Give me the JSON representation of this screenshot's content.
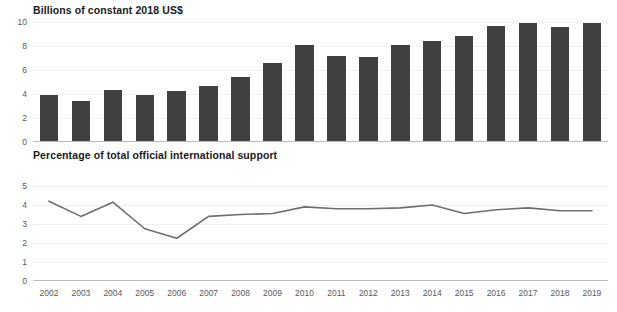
{
  "chart_data": [
    {
      "type": "bar",
      "title": "Billions of constant 2018 US$",
      "xlabel": "",
      "ylabel": "",
      "ylim": [
        0,
        10
      ],
      "yticks": [
        0,
        2,
        4,
        6,
        8,
        10
      ],
      "grid": true,
      "legend": "none",
      "bar_color": "#404042",
      "categories": [
        "2002",
        "2003",
        "2004",
        "2005",
        "2006",
        "2007",
        "2008",
        "2009",
        "2010",
        "2011",
        "2012",
        "2013",
        "2014",
        "2015",
        "2016",
        "2017",
        "2018",
        "2019"
      ],
      "values": [
        3.95,
        3.45,
        4.3,
        3.9,
        4.25,
        4.7,
        5.45,
        6.6,
        8.05,
        7.15,
        7.1,
        8.05,
        8.4,
        8.85,
        9.65,
        9.95,
        9.6,
        9.9
      ]
    },
    {
      "type": "line",
      "title": "Percentage of total official international support",
      "xlabel": "",
      "ylabel": "",
      "ylim": [
        0,
        5
      ],
      "yticks": [
        0,
        1,
        2,
        3,
        4,
        5
      ],
      "grid": true,
      "legend": "none",
      "line_color": "#6d6e71",
      "categories": [
        "2002",
        "2003",
        "2004",
        "2005",
        "2006",
        "2007",
        "2008",
        "2009",
        "2010",
        "2011",
        "2012",
        "2013",
        "2014",
        "2015",
        "2016",
        "2017",
        "2018",
        "2019"
      ],
      "values": [
        4.2,
        3.4,
        4.15,
        2.75,
        2.25,
        3.4,
        3.5,
        3.55,
        3.9,
        3.8,
        3.8,
        3.85,
        4.0,
        3.55,
        3.75,
        3.85,
        3.7,
        3.7
      ]
    }
  ],
  "colors": {
    "bar": "#404042",
    "line": "#6d6e71",
    "grid": "#f0f0f0",
    "axis": "#b9b9b9",
    "tick_text": "#58595b",
    "title_text": "#1a1a1a"
  }
}
